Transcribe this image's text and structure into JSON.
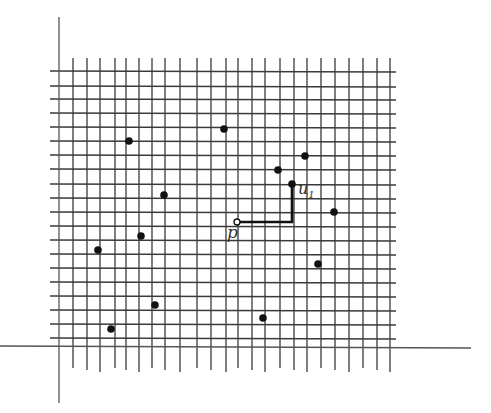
{
  "diagram": {
    "type": "grid-point-diagram",
    "labels": {
      "p": "p",
      "u1": "u",
      "u1_sub": "1"
    },
    "colors": {
      "grid": "#3a3a3a",
      "axis": "#555555",
      "point": "#111111",
      "path": "#111111"
    },
    "axes": {
      "vertical": {
        "x": 59,
        "y1": 17,
        "y2": 403
      },
      "horizontal": {
        "y": 347,
        "x1": 0,
        "x2": 471
      }
    },
    "grid": {
      "x_lines": [
        73,
        87,
        100,
        115,
        126,
        139,
        152,
        165,
        180,
        197,
        211,
        226,
        238,
        252,
        265,
        280,
        294,
        307,
        321,
        335,
        349,
        363,
        377,
        390
      ],
      "x_range": [
        57,
        70
      ],
      "x_line_top": 58,
      "x_line_bottom": 368,
      "y_lines": [
        71,
        86,
        99,
        113,
        127,
        141,
        155,
        169,
        184,
        198,
        212,
        226,
        240,
        254,
        268,
        282,
        296,
        310,
        324,
        338
      ],
      "y_line_left": 50,
      "y_line_right": 396
    },
    "points": [
      {
        "x": 129,
        "y": 141
      },
      {
        "x": 224,
        "y": 129
      },
      {
        "x": 164,
        "y": 195
      },
      {
        "x": 141,
        "y": 236
      },
      {
        "x": 98,
        "y": 250
      },
      {
        "x": 155,
        "y": 305
      },
      {
        "x": 111,
        "y": 329
      },
      {
        "x": 278,
        "y": 170
      },
      {
        "x": 305,
        "y": 156
      },
      {
        "x": 292,
        "y": 184
      },
      {
        "x": 334,
        "y": 212
      },
      {
        "x": 318,
        "y": 264
      },
      {
        "x": 263,
        "y": 318
      }
    ],
    "p": {
      "x": 237,
      "y": 222
    },
    "u1": {
      "x": 292,
      "y": 184
    },
    "path": [
      [
        237,
        222
      ],
      [
        292,
        222
      ],
      [
        292,
        184
      ]
    ]
  }
}
